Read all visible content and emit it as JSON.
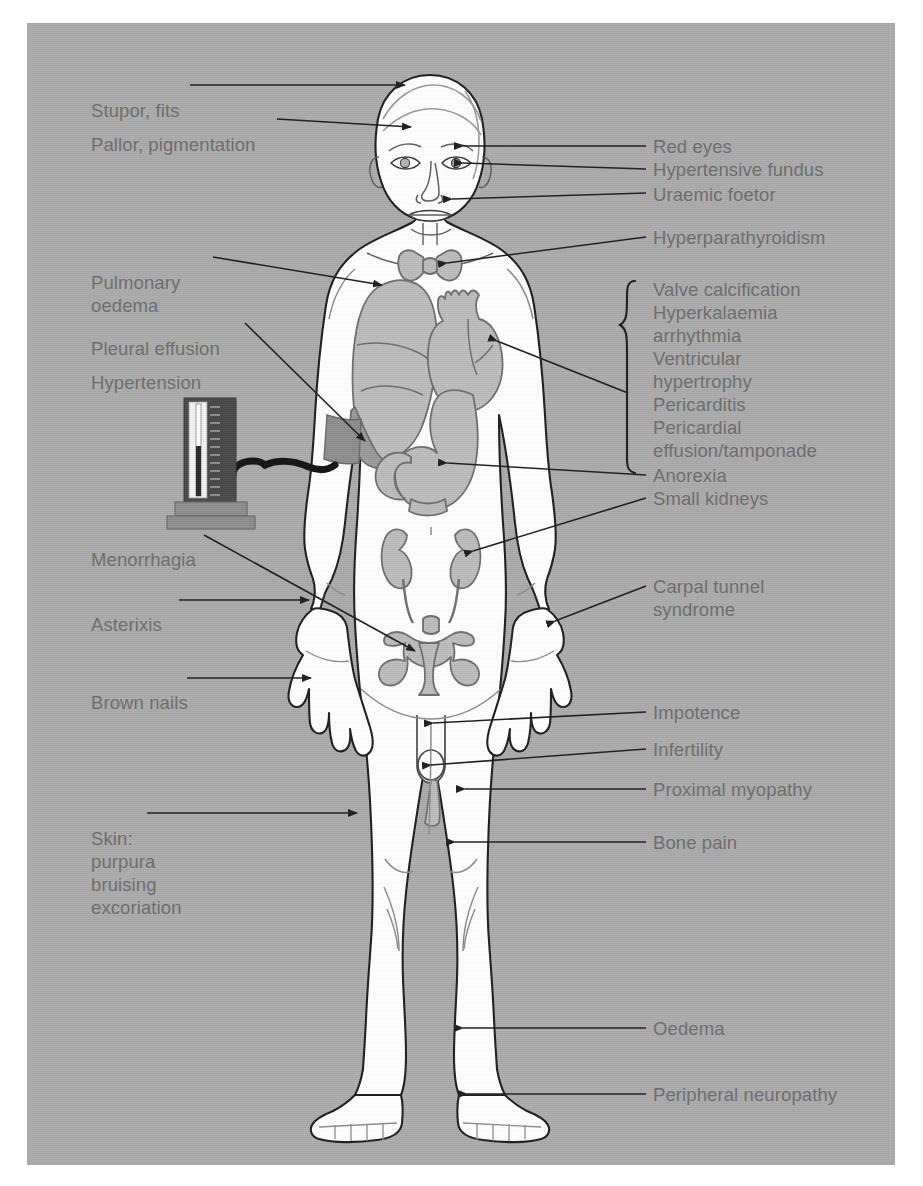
{
  "figure": {
    "type": "annotated-anatomical-diagram",
    "background_color": "#ababab",
    "label_text_color": "#6e6e6e",
    "leader_line_color": "#231f20",
    "organ_fill_color": "#b9b9b9",
    "body_fill_color": "#ffffff"
  },
  "labels_left": [
    {
      "id": "stupor-fits",
      "text": "Stupor, fits",
      "x": 64,
      "y": 78
    },
    {
      "id": "pallor-pigmentation",
      "text": "Pallor, pigmentation",
      "x": 64,
      "y": 112
    },
    {
      "id": "pulmonary-oedema",
      "text": "Pulmonary",
      "x": 64,
      "y": 250
    },
    {
      "id": "pulmonary-oedema-2",
      "text": "oedema",
      "x": 64,
      "y": 273
    },
    {
      "id": "pleural-effusion",
      "text": "Pleural effusion",
      "x": 64,
      "y": 316
    },
    {
      "id": "hypertension",
      "text": "Hypertension",
      "x": 64,
      "y": 350
    },
    {
      "id": "menorrhagia",
      "text": "Menorrhagia",
      "x": 64,
      "y": 527
    },
    {
      "id": "asterixis",
      "text": "Asterixis",
      "x": 64,
      "y": 592
    },
    {
      "id": "brown-nails",
      "text": "Brown nails",
      "x": 64,
      "y": 670
    },
    {
      "id": "skin",
      "text": "Skin:",
      "x": 64,
      "y": 806
    },
    {
      "id": "skin-purpura",
      "text": "purpura",
      "x": 64,
      "y": 829
    },
    {
      "id": "skin-bruising",
      "text": "bruising",
      "x": 64,
      "y": 852
    },
    {
      "id": "skin-excoriation",
      "text": "excoriation",
      "x": 64,
      "y": 875
    }
  ],
  "labels_right": [
    {
      "id": "red-eyes",
      "text": "Red eyes",
      "x": 648,
      "y": 137
    },
    {
      "id": "hypertensive-fundus",
      "text": "Hypertensive fundus",
      "x": 648,
      "y": 160
    },
    {
      "id": "uraemic-foetor",
      "text": "Uraemic foetor",
      "x": 648,
      "y": 185
    },
    {
      "id": "hyperparathyroidism",
      "text": "Hyperparathyroidism",
      "x": 648,
      "y": 228
    },
    {
      "id": "anorexia",
      "text": "Anorexia",
      "x": 648,
      "y": 466
    },
    {
      "id": "small-kidneys",
      "text": "Small kidneys",
      "x": 648,
      "y": 489
    },
    {
      "id": "carpal-tunnel",
      "text": "Carpal tunnel",
      "x": 648,
      "y": 577
    },
    {
      "id": "carpal-tunnel-2",
      "text": "syndrome",
      "x": 648,
      "y": 600
    },
    {
      "id": "impotence",
      "text": "Impotence",
      "x": 648,
      "y": 703
    },
    {
      "id": "infertility",
      "text": "Infertility",
      "x": 648,
      "y": 740
    },
    {
      "id": "proximal-myopathy",
      "text": "Proximal myopathy",
      "x": 648,
      "y": 780
    },
    {
      "id": "bone-pain",
      "text": "Bone pain",
      "x": 648,
      "y": 833
    },
    {
      "id": "oedema",
      "text": "Oedema",
      "x": 648,
      "y": 1019
    },
    {
      "id": "peripheral-neuropathy",
      "text": "Peripheral neuropathy",
      "x": 648,
      "y": 1085
    }
  ],
  "bracket_group": {
    "id": "cardiac-bracket-group",
    "bracket_x": 628,
    "bracket_top": 275,
    "bracket_bottom": 455,
    "items": [
      {
        "id": "valve-calcification",
        "text": "Valve calcification",
        "x": 648,
        "y": 280
      },
      {
        "id": "hyperkalaemia",
        "text": "Hyperkalaemia",
        "x": 648,
        "y": 303
      },
      {
        "id": "arrhythmia",
        "text": "arrhythmia",
        "x": 648,
        "y": 326
      },
      {
        "id": "ventricular",
        "text": "Ventricular",
        "x": 648,
        "y": 349
      },
      {
        "id": "hypertrophy",
        "text": "hypertrophy",
        "x": 648,
        "y": 372
      },
      {
        "id": "pericarditis",
        "text": "Pericarditis",
        "x": 648,
        "y": 395
      },
      {
        "id": "pericardial",
        "text": "Pericardial",
        "x": 648,
        "y": 418
      },
      {
        "id": "effusion-tamponade",
        "text": "effusion/tamponade",
        "x": 648,
        "y": 441
      }
    ]
  },
  "device": {
    "id": "sphygmomanometer",
    "name": "mercury sphygmomanometer",
    "column_color": "#4a4a4a",
    "scale_color": "#f2f2f2",
    "base_color": "#8e8e8e",
    "tube_color": "#1a1a1a",
    "cuff_color": "#8e8e8e"
  },
  "organs": [
    {
      "id": "brain-region",
      "name": "head"
    },
    {
      "id": "eye-left",
      "name": "eye"
    },
    {
      "id": "eye-right",
      "name": "eye"
    },
    {
      "id": "mouth",
      "name": "mouth"
    },
    {
      "id": "thyroid",
      "name": "thyroid / parathyroid glands"
    },
    {
      "id": "lung",
      "name": "lung with pleural effusion"
    },
    {
      "id": "heart",
      "name": "heart"
    },
    {
      "id": "stomach",
      "name": "stomach and duodenum"
    },
    {
      "id": "kidney-left",
      "name": "kidney"
    },
    {
      "id": "kidney-right",
      "name": "kidney"
    },
    {
      "id": "pelvis-uterus",
      "name": "pelvis and uterus"
    },
    {
      "id": "genitalia",
      "name": "genitalia"
    },
    {
      "id": "hand-left",
      "name": "hand"
    },
    {
      "id": "hand-right",
      "name": "hand"
    },
    {
      "id": "foot-left",
      "name": "foot"
    },
    {
      "id": "foot-right",
      "name": "foot"
    }
  ]
}
